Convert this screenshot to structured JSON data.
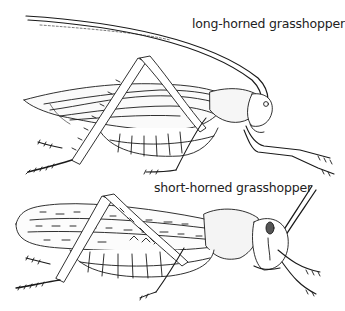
{
  "figure": {
    "cropped_caption_fragment": "",
    "labels": {
      "long_horned": "long-horned grasshopper",
      "short_horned": "short-horned grasshopper"
    },
    "style": {
      "ink_color": "#1a1a1a",
      "background": "#ffffff"
    }
  }
}
